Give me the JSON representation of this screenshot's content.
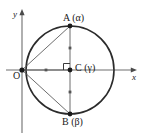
{
  "figure": {
    "background_color": "#ffffff",
    "stroke_color": "#2b2b2b",
    "axes": {
      "x_label": "x",
      "y_label": "y",
      "origin_label": "O"
    },
    "points": [
      {
        "id": "A",
        "label": "A (α)",
        "name": "A",
        "parameter": "α",
        "x": 70,
        "y": 26
      },
      {
        "id": "C",
        "label": "C (γ)",
        "name": "C",
        "parameter": "γ",
        "x": 70,
        "y": 70
      },
      {
        "id": "B",
        "label": "B (β)",
        "name": "B",
        "parameter": "β",
        "x": 70,
        "y": 114
      },
      {
        "id": "O",
        "label": "O",
        "name": "O",
        "parameter": "",
        "x": 22,
        "y": 70
      }
    ],
    "circle": {
      "center_x": 70,
      "center_y": 70,
      "radius": 44
    },
    "segments": [
      {
        "from": "O",
        "to": "A"
      },
      {
        "from": "O",
        "to": "B"
      },
      {
        "from": "A",
        "to": "B"
      },
      {
        "from": "O",
        "to": "C"
      }
    ],
    "tick_marks": {
      "count": 4,
      "description": "congruence ticks on OC and on AC, CB"
    },
    "right_angle_marker": {
      "at": "C",
      "size": 6
    }
  }
}
